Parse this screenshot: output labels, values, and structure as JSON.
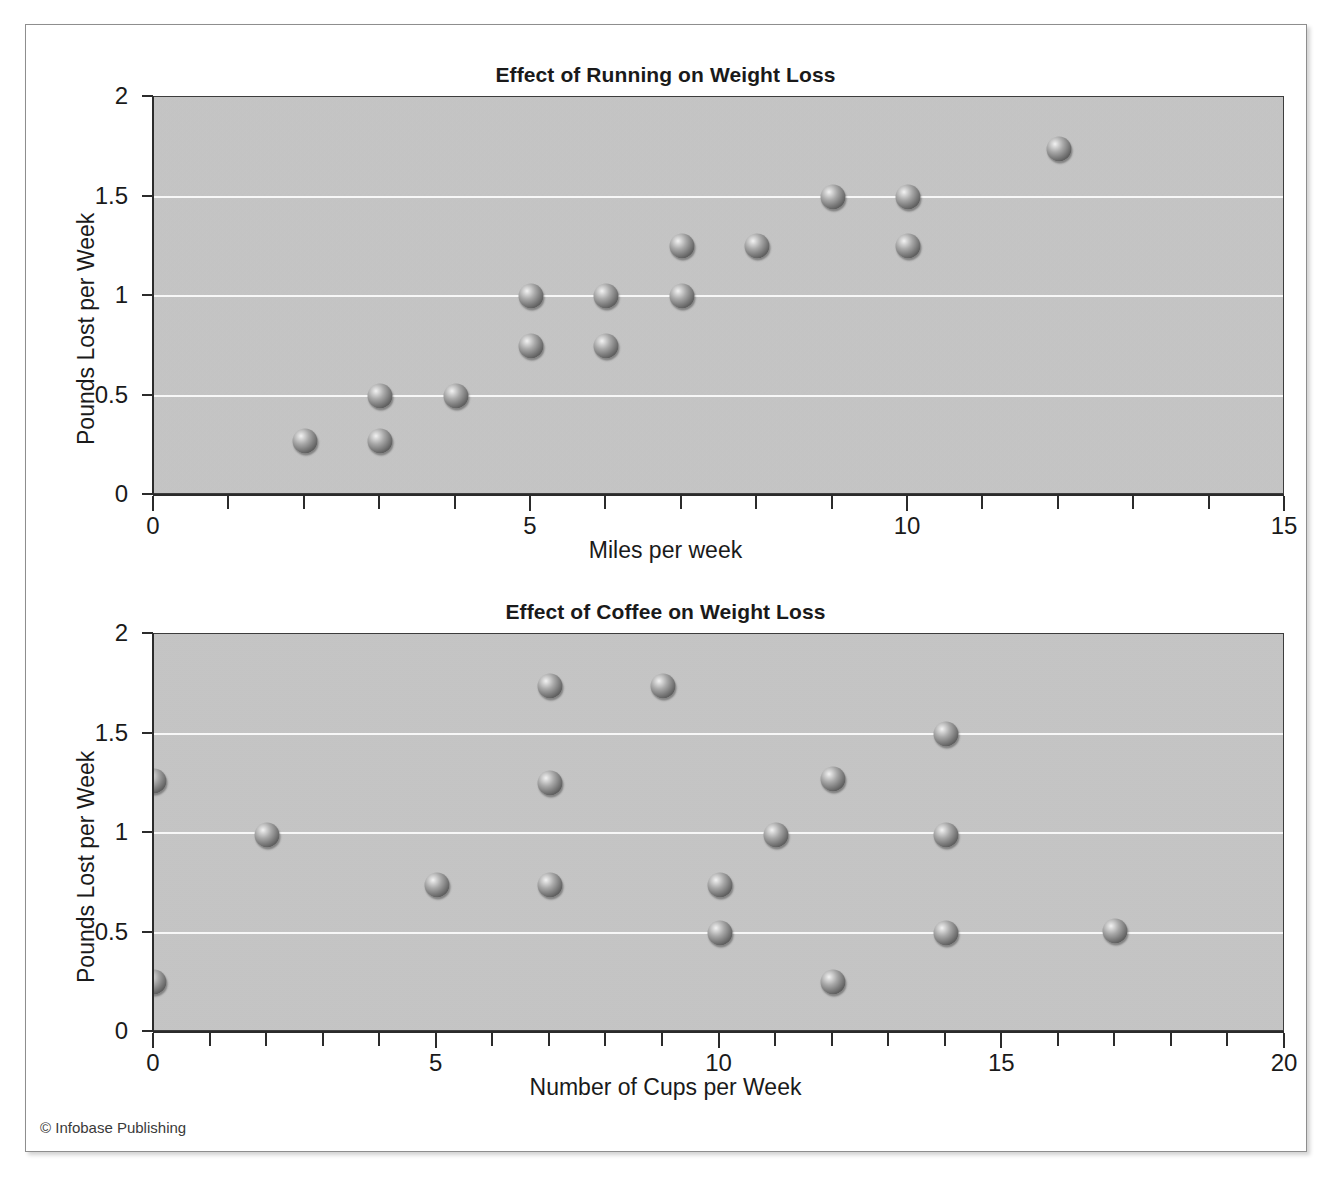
{
  "page": {
    "copyright": "© Infobase Publishing"
  },
  "chart_data": [
    {
      "type": "scatter",
      "title": "Effect of Running on Weight Loss",
      "xlabel": "Miles per week",
      "ylabel": "Pounds Lost per Week",
      "xlim": [
        0,
        15
      ],
      "ylim": [
        0,
        2
      ],
      "xticks": [
        0,
        5,
        10,
        15
      ],
      "xtick_labels": [
        "0",
        "5",
        "10",
        "15"
      ],
      "xminor_step": 1,
      "yticks": [
        0,
        0.5,
        1,
        1.5,
        2
      ],
      "ytick_labels": [
        "0",
        "0.5",
        "1",
        "1.5",
        "2"
      ],
      "grid": "horizontal",
      "legend": "none",
      "points": [
        {
          "x": 2,
          "y": 0.27
        },
        {
          "x": 3,
          "y": 0.5
        },
        {
          "x": 3,
          "y": 0.27
        },
        {
          "x": 4,
          "y": 0.5
        },
        {
          "x": 5,
          "y": 1.0
        },
        {
          "x": 5,
          "y": 0.75
        },
        {
          "x": 6,
          "y": 1.0
        },
        {
          "x": 6,
          "y": 0.75
        },
        {
          "x": 7,
          "y": 1.25
        },
        {
          "x": 7,
          "y": 1.0
        },
        {
          "x": 8,
          "y": 1.25
        },
        {
          "x": 9,
          "y": 1.5
        },
        {
          "x": 10,
          "y": 1.5
        },
        {
          "x": 10,
          "y": 1.25
        },
        {
          "x": 12,
          "y": 1.74
        }
      ]
    },
    {
      "type": "scatter",
      "title": "Effect of Coffee on Weight Loss",
      "xlabel": "Number of Cups per Week",
      "ylabel": "Pounds Lost per Week",
      "xlim": [
        0,
        20
      ],
      "ylim": [
        0,
        2
      ],
      "xticks": [
        0,
        5,
        10,
        15,
        20
      ],
      "xtick_labels": [
        "0",
        "5",
        "10",
        "15",
        "20"
      ],
      "xminor_step": 1,
      "yticks": [
        0,
        0.5,
        1,
        1.5,
        2
      ],
      "ytick_labels": [
        "0",
        "0.5",
        "1",
        "1.5",
        "2"
      ],
      "grid": "horizontal",
      "legend": "none",
      "points": [
        {
          "x": 0,
          "y": 1.26
        },
        {
          "x": 0,
          "y": 0.25
        },
        {
          "x": 2,
          "y": 0.99
        },
        {
          "x": 5,
          "y": 0.74
        },
        {
          "x": 7,
          "y": 1.74
        },
        {
          "x": 7,
          "y": 1.25
        },
        {
          "x": 7,
          "y": 0.74
        },
        {
          "x": 9,
          "y": 1.74
        },
        {
          "x": 10,
          "y": 0.74
        },
        {
          "x": 10,
          "y": 0.5
        },
        {
          "x": 11,
          "y": 0.99
        },
        {
          "x": 12,
          "y": 1.27
        },
        {
          "x": 12,
          "y": 0.25
        },
        {
          "x": 14,
          "y": 1.5
        },
        {
          "x": 14,
          "y": 0.99
        },
        {
          "x": 14,
          "y": 0.5
        },
        {
          "x": 17,
          "y": 0.51
        }
      ]
    }
  ]
}
